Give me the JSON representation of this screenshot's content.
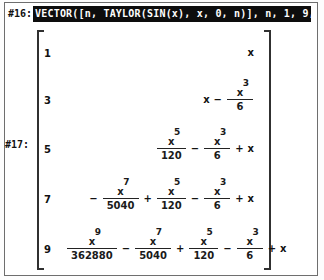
{
  "app": {
    "name": "derive-cas",
    "variable": "x"
  },
  "expressions": [
    {
      "label": "#16:",
      "text": "VECTOR([n, TAYLOR(SIN(x), x, 0, n)], n, 1, 9, 2)",
      "highlighted": true
    },
    {
      "label": "#17:",
      "highlighted": false,
      "result_kind": "matrix",
      "bracket_left": "[",
      "bracket_right": "]"
    }
  ],
  "matrix": {
    "rows": [
      {
        "order": "1",
        "terms": [
          {
            "kind": "var",
            "sign": "",
            "base": "x",
            "power": ""
          }
        ]
      },
      {
        "order": "3",
        "terms": [
          {
            "kind": "var",
            "sign": "",
            "base": "x",
            "power": ""
          },
          {
            "kind": "frac",
            "sign": "-",
            "base": "x",
            "power": "3",
            "den": "6"
          }
        ]
      },
      {
        "order": "5",
        "terms": [
          {
            "kind": "frac",
            "sign": "",
            "base": "x",
            "power": "5",
            "den": "120"
          },
          {
            "kind": "frac",
            "sign": "-",
            "base": "x",
            "power": "3",
            "den": "6"
          },
          {
            "kind": "var",
            "sign": "+",
            "base": "x",
            "power": ""
          }
        ]
      },
      {
        "order": "7",
        "terms": [
          {
            "kind": "frac",
            "sign": "-",
            "base": "x",
            "power": "7",
            "den": "5040"
          },
          {
            "kind": "frac",
            "sign": "+",
            "base": "x",
            "power": "5",
            "den": "120"
          },
          {
            "kind": "frac",
            "sign": "-",
            "base": "x",
            "power": "3",
            "den": "6"
          },
          {
            "kind": "var",
            "sign": "+",
            "base": "x",
            "power": ""
          }
        ]
      },
      {
        "order": "9",
        "terms": [
          {
            "kind": "frac",
            "sign": "",
            "base": "x",
            "power": "9",
            "den": "362880"
          },
          {
            "kind": "frac",
            "sign": "-",
            "base": "x",
            "power": "7",
            "den": "5040"
          },
          {
            "kind": "frac",
            "sign": "+",
            "base": "x",
            "power": "5",
            "den": "120"
          },
          {
            "kind": "frac",
            "sign": "-",
            "base": "x",
            "power": "3",
            "den": "6"
          },
          {
            "kind": "var",
            "sign": "+",
            "base": "x",
            "power": ""
          }
        ]
      }
    ]
  },
  "colors": {
    "background": "#ffffff",
    "text": "#1a1a1a",
    "highlight_bg": "#0d0d0d",
    "highlight_fg": "#fdfdfd",
    "frame": "#6e6e6e"
  }
}
